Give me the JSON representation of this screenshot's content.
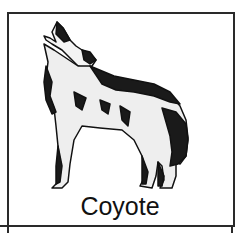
{
  "card": {
    "caption": "Coyote",
    "illustration": "howling-coyote-icon",
    "colors": {
      "border": "#2a2a2a",
      "ink": "#111111",
      "background": "#ffffff"
    }
  }
}
